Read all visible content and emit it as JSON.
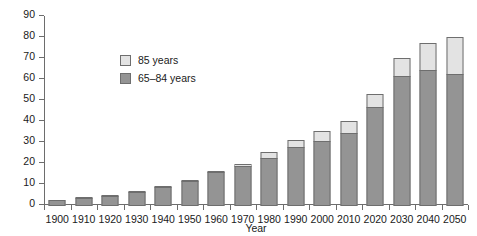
{
  "chart_data": {
    "type": "bar",
    "stacked": true,
    "title": "",
    "xlabel": "Year",
    "ylabel": "Number",
    "ylim": [
      0,
      90
    ],
    "ytick_step": 10,
    "yticks": [
      0,
      10,
      20,
      30,
      40,
      50,
      60,
      70,
      80,
      90
    ],
    "grid": false,
    "legend_position": "inside-upper-left",
    "categories": [
      "1900",
      "1910",
      "1920",
      "1930",
      "1940",
      "1950",
      "1960",
      "1970",
      "1980",
      "1990",
      "2000",
      "2010",
      "2020",
      "2030",
      "2040",
      "2050"
    ],
    "series": [
      {
        "name": "65–84 years",
        "color": "#949494",
        "values": [
          3,
          4,
          5,
          6.5,
          9,
          12,
          16,
          19,
          23,
          28,
          31,
          35,
          47,
          62,
          65,
          63
        ]
      },
      {
        "name": "85 years",
        "color": "#e3e3e3",
        "values": [
          0,
          0.3,
          0.4,
          0.5,
          0.5,
          1,
          1,
          1.5,
          3,
          4,
          5,
          6,
          7,
          9,
          13,
          18
        ]
      }
    ],
    "totals": [
      3,
      4.3,
      5.4,
      7,
      9.5,
      13,
      17,
      20.5,
      26,
      32,
      36,
      41,
      54,
      71,
      78,
      81
    ]
  },
  "legend": {
    "items": [
      {
        "label": "85 years",
        "color": "#e3e3e3"
      },
      {
        "label": "65–84 years",
        "color": "#949494"
      }
    ]
  },
  "axes": {
    "y_title": "Number",
    "x_title": "Year"
  }
}
